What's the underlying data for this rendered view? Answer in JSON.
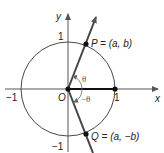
{
  "diagram": {
    "type": "unit-circle",
    "axes": {
      "x_label": "x",
      "y_label": "y"
    },
    "ticks": {
      "x_pos": "1",
      "x_neg": "−1",
      "y_pos": "1",
      "y_neg": "−1",
      "origin": "O"
    },
    "points": {
      "P": {
        "label": "P = (a, b)"
      },
      "Q": {
        "label": "Q = (a, −b)"
      }
    },
    "angles": {
      "positive": "θ",
      "negative": "−θ"
    },
    "colors": {
      "stroke": "#222222",
      "ray": "#333333",
      "angle_arc": "#666666"
    }
  }
}
